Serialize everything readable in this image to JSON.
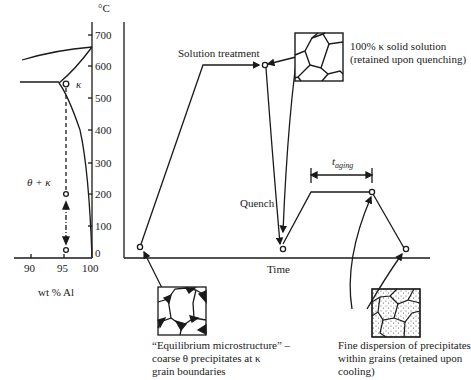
{
  "phase_diagram": {
    "unit_label": "°C",
    "y_ticks": [
      "700",
      "600",
      "500",
      "400",
      "300",
      "200",
      "100",
      "0"
    ],
    "x_ticks": [
      "90",
      "95",
      "100"
    ],
    "x_axis_label": "wt % Al",
    "phase_kappa": "κ",
    "phase_theta_kappa": "θ + κ"
  },
  "process": {
    "x_axis_label": "Time",
    "solution_treatment": "Solution treatment",
    "quench": "Quench",
    "t_aging_main": "t",
    "t_aging_sub": "aging"
  },
  "annotations": {
    "solid_solution_line1": "100% κ solid solution",
    "solid_solution_line2": "(retained upon quenching)",
    "equilibrium_line1": "“Equilibrium microstructure” –",
    "equilibrium_line2": "coarse θ precipitates at κ",
    "equilibrium_line3": "grain boundaries",
    "fine_line1": "Fine dispersion of precipitates",
    "fine_line2": "within grains (retained upon",
    "fine_line3": "cooling)"
  }
}
